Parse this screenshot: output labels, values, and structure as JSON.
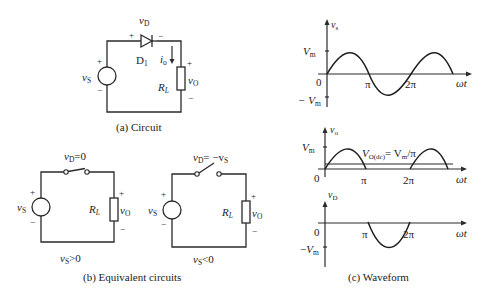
{
  "panels": {
    "circuit": {
      "caption": "(a) Circuit",
      "source_label_main": "v",
      "source_label_sub": "S",
      "diode_name_main": "D",
      "diode_name_sub": "1",
      "diode_voltage_main": "v",
      "diode_voltage_sub": "D",
      "current_main": "i",
      "current_sub": "o",
      "load_main": "R",
      "load_sub": "L",
      "output_main": "v",
      "output_sub": "O",
      "plus": "+",
      "minus": "−"
    },
    "equivalent": {
      "caption": "(b) Equivalent circuits",
      "left": {
        "switch_label_main": "v",
        "switch_label_sub": "D",
        "switch_label_rest": "=0",
        "condition_main": "v",
        "condition_sub": "S",
        "condition_rest": ">0",
        "switch_state": "closed"
      },
      "right": {
        "switch_label_main": "v",
        "switch_label_sub": "D",
        "switch_label_rest": "= −v",
        "switch_label_sub2": "S",
        "condition_main": "v",
        "condition_sub": "S",
        "condition_rest": "<0",
        "switch_state": "open"
      },
      "source_main": "v",
      "source_sub": "S",
      "load_main": "R",
      "load_sub": "L",
      "output_main": "v",
      "output_sub": "O",
      "plus": "+",
      "minus": "−"
    },
    "waveform": {
      "caption": "(c) Waveform",
      "x_label": "ωt",
      "tick_pi": "π",
      "tick_2pi": "2π",
      "origin": "0",
      "vm_main": "V",
      "vm_sub": "m",
      "neg_vm": "− V",
      "plots": [
        {
          "ylabel_main": "v",
          "ylabel_sub": "s",
          "kind": "full sine"
        },
        {
          "ylabel_main": "v",
          "ylabel_sub": "o",
          "kind": "half-wave rectified",
          "dc_main": "V",
          "dc_sub": "O(dc)",
          "dc_rest": "= V",
          "dc_sub2": "m",
          "dc_tail": "/π"
        },
        {
          "ylabel_main": "v",
          "ylabel_sub": "D",
          "kind": "negative half only"
        }
      ]
    }
  }
}
